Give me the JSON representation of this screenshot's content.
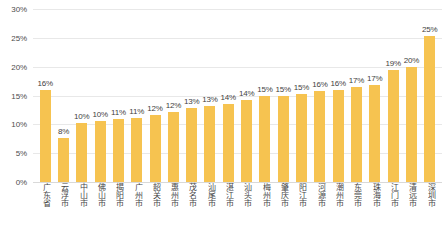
{
  "chart_data": {
    "type": "bar",
    "title": "",
    "xlabel": "",
    "ylabel": "",
    "ylim": [
      0,
      30
    ],
    "grid": true,
    "legend": "none",
    "bar_color": "#F6C350",
    "y_ticks": [
      "0%",
      "5%",
      "10%",
      "15%",
      "20%",
      "25%",
      "30%"
    ],
    "y_tick_values": [
      0,
      5,
      10,
      15,
      20,
      25,
      30
    ],
    "categories": [
      "广东省",
      "云浮市",
      "中山市",
      "佛山市",
      "揭阳市",
      "广州市",
      "韶关市",
      "惠州市",
      "茂名市",
      "汕尾市",
      "湛江市",
      "汕头市",
      "梅州市",
      "肇庆市",
      "阳江市",
      "河源市",
      "潮州市",
      "东莞市",
      "珠海市",
      "江门市",
      "清远市",
      "深圳市"
    ],
    "values": [
      16,
      8,
      10,
      10,
      11,
      11,
      12,
      12,
      13,
      13,
      14,
      14,
      15,
      15,
      15,
      16,
      16,
      17,
      17,
      19,
      20,
      25
    ],
    "plot_values": [
      15.9,
      7.6,
      10.2,
      10.5,
      11.0,
      11.1,
      11.7,
      12.2,
      12.8,
      13.1,
      13.6,
      14.3,
      14.9,
      14.9,
      15.2,
      15.7,
      16.0,
      16.5,
      16.8,
      19.4,
      20.0,
      25.3
    ],
    "data_labels": [
      "16%",
      "8%",
      "10%",
      "10%",
      "11%",
      "11%",
      "12%",
      "12%",
      "13%",
      "13%",
      "14%",
      "14%",
      "15%",
      "15%",
      "15%",
      "16%",
      "16%",
      "17%",
      "17%",
      "19%",
      "20%",
      "25%"
    ]
  },
  "caption": {
    "text": ""
  }
}
